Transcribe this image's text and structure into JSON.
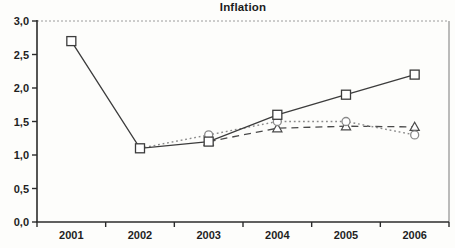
{
  "page": {
    "background": "#fdfdfb"
  },
  "chart_data": {
    "type": "line",
    "title": "Inflation",
    "xlabel": "",
    "ylabel": "",
    "categories": [
      "2001",
      "2002",
      "2003",
      "2004",
      "2005",
      "2006"
    ],
    "y_ticks": [
      "0,0",
      "0,5",
      "1,0",
      "1,5",
      "2,0",
      "2,5",
      "3,0"
    ],
    "y_tick_values": [
      0,
      0.5,
      1,
      1.5,
      2,
      2.5,
      3
    ],
    "ylim": [
      0,
      3
    ],
    "grid": false,
    "legend": "none",
    "frame": {
      "axis_color": "#2b2b2b",
      "top_border_color": "#9c9c9c",
      "right_border_color": "#8f8f8f"
    },
    "series": [
      {
        "marker": "square",
        "line_style": "solid",
        "color": "#3c3c3c",
        "values": [
          2.7,
          1.1,
          1.2,
          1.6,
          1.9,
          2.2
        ]
      },
      {
        "marker": "circle",
        "line_style": "dotted",
        "color": "#8a8a8a",
        "values": [
          null,
          1.1,
          1.3,
          1.5,
          1.5,
          1.3
        ]
      },
      {
        "marker": "triangle",
        "line_style": "dashed",
        "color": "#4a4a4a",
        "values": [
          null,
          null,
          1.2,
          1.4,
          1.43,
          1.42
        ]
      }
    ]
  }
}
